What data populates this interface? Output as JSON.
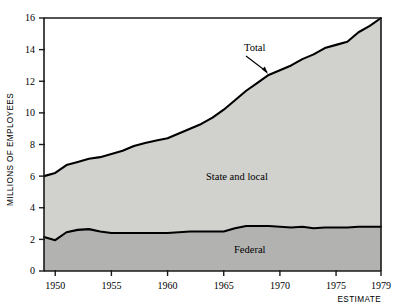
{
  "chart_data": {
    "type": "area",
    "title": "",
    "subtitle": "",
    "xlabel": "",
    "ylabel": "MILLIONS OF EMPLOYEES",
    "stacked": true,
    "grid": false,
    "legend_position": "inline-annotations",
    "xlim": [
      1949,
      1979
    ],
    "ylim": [
      0,
      16
    ],
    "x_tick_labels": [
      "1950",
      "1955",
      "1960",
      "1965",
      "1970",
      "1975",
      "1979"
    ],
    "x_tick_values": [
      1950,
      1955,
      1960,
      1965,
      1970,
      1975,
      1979
    ],
    "y_tick_labels": [
      "0",
      "2",
      "4",
      "6",
      "8",
      "10",
      "12",
      "14",
      "16"
    ],
    "y_tick_values": [
      0,
      2,
      4,
      6,
      8,
      10,
      12,
      14,
      16
    ],
    "x": [
      1949,
      1950,
      1951,
      1952,
      1953,
      1954,
      1955,
      1956,
      1957,
      1958,
      1959,
      1960,
      1961,
      1962,
      1963,
      1964,
      1965,
      1966,
      1967,
      1968,
      1969,
      1970,
      1971,
      1972,
      1973,
      1974,
      1975,
      1976,
      1977,
      1978,
      1979
    ],
    "series": [
      {
        "name": "Federal",
        "label": "Federal",
        "color": "#b2b2b0",
        "values": [
          2.15,
          1.95,
          2.45,
          2.6,
          2.65,
          2.5,
          2.4,
          2.4,
          2.4,
          2.4,
          2.4,
          2.4,
          2.45,
          2.5,
          2.5,
          2.5,
          2.5,
          2.7,
          2.85,
          2.85,
          2.85,
          2.8,
          2.75,
          2.8,
          2.7,
          2.75,
          2.75,
          2.75,
          2.8,
          2.8,
          2.8
        ]
      },
      {
        "name": "State and local",
        "label": "State and local",
        "color": "#d1d1cd",
        "values": [
          3.85,
          4.25,
          4.25,
          4.3,
          4.45,
          4.7,
          5.0,
          5.2,
          5.5,
          5.7,
          5.85,
          6.0,
          6.25,
          6.5,
          6.8,
          7.2,
          7.7,
          8.1,
          8.55,
          9.05,
          9.55,
          9.9,
          10.25,
          10.6,
          11.0,
          11.35,
          11.55,
          11.75,
          12.3,
          12.7,
          13.2
        ]
      }
    ],
    "total": {
      "name": "Total",
      "label": "Total",
      "values": [
        6.0,
        6.2,
        6.7,
        6.9,
        7.1,
        7.2,
        7.4,
        7.6,
        7.9,
        8.1,
        8.25,
        8.4,
        8.7,
        9.0,
        9.3,
        9.7,
        10.2,
        10.8,
        11.4,
        11.9,
        12.4,
        12.7,
        13.0,
        13.4,
        13.7,
        14.1,
        14.3,
        14.5,
        15.1,
        15.5,
        16.0
      ]
    },
    "annotations": [
      {
        "text": "Total",
        "x": 1969.0,
        "y": 13.9,
        "kind": "callout-with-leader"
      },
      {
        "text": "State and local",
        "x": 1966.5,
        "y": 7.1,
        "kind": "band-label"
      },
      {
        "text": "Federal",
        "x": 1970.5,
        "y": 1.5,
        "kind": "band-label"
      },
      {
        "text": "ESTIMATE",
        "x": 1979,
        "y": -1.4,
        "kind": "axis-note"
      }
    ],
    "colors": {
      "federal_fill": "#b2b2b0",
      "state_local_fill": "#d1d1cd",
      "axis": "#1a1a1a",
      "curve": "#000000",
      "background": "#ffffff"
    }
  }
}
